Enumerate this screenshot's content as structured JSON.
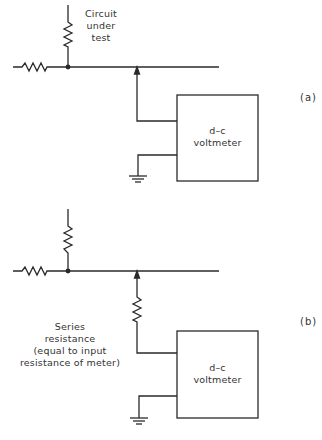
{
  "figure": {
    "panel_a": {
      "label": "(a)",
      "circuit_label": [
        "Circuit",
        "under",
        "test"
      ],
      "meter_label": [
        "d–c",
        "voltmeter"
      ]
    },
    "panel_b": {
      "label": "(b)",
      "series_label": [
        "Series",
        "resistance",
        "(equal to input",
        "resistance of meter)"
      ],
      "meter_label": [
        "d–c",
        "voltmeter"
      ]
    },
    "colors": {
      "line": "#2a2a2a",
      "background": "#ffffff"
    }
  }
}
